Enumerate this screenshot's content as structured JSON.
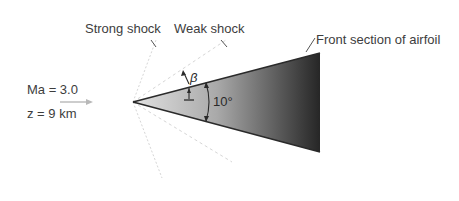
{
  "diagram": {
    "labels": {
      "strong_shock": "Strong shock",
      "weak_shock": "Weak shock",
      "airfoil": "Front section of airfoil",
      "mach": "Ma = 3.0",
      "altitude": "z = 9 km",
      "beta": "β",
      "wedge_angle": "10°"
    },
    "colors": {
      "wedge_dark": "#2b2b2b",
      "wedge_light": "#d9d9d9",
      "edge": "#2a2a2a",
      "shock_line": "#d8d8d8",
      "flow_arrow": "#b8b8b8",
      "text": "#3d3d3d"
    }
  }
}
